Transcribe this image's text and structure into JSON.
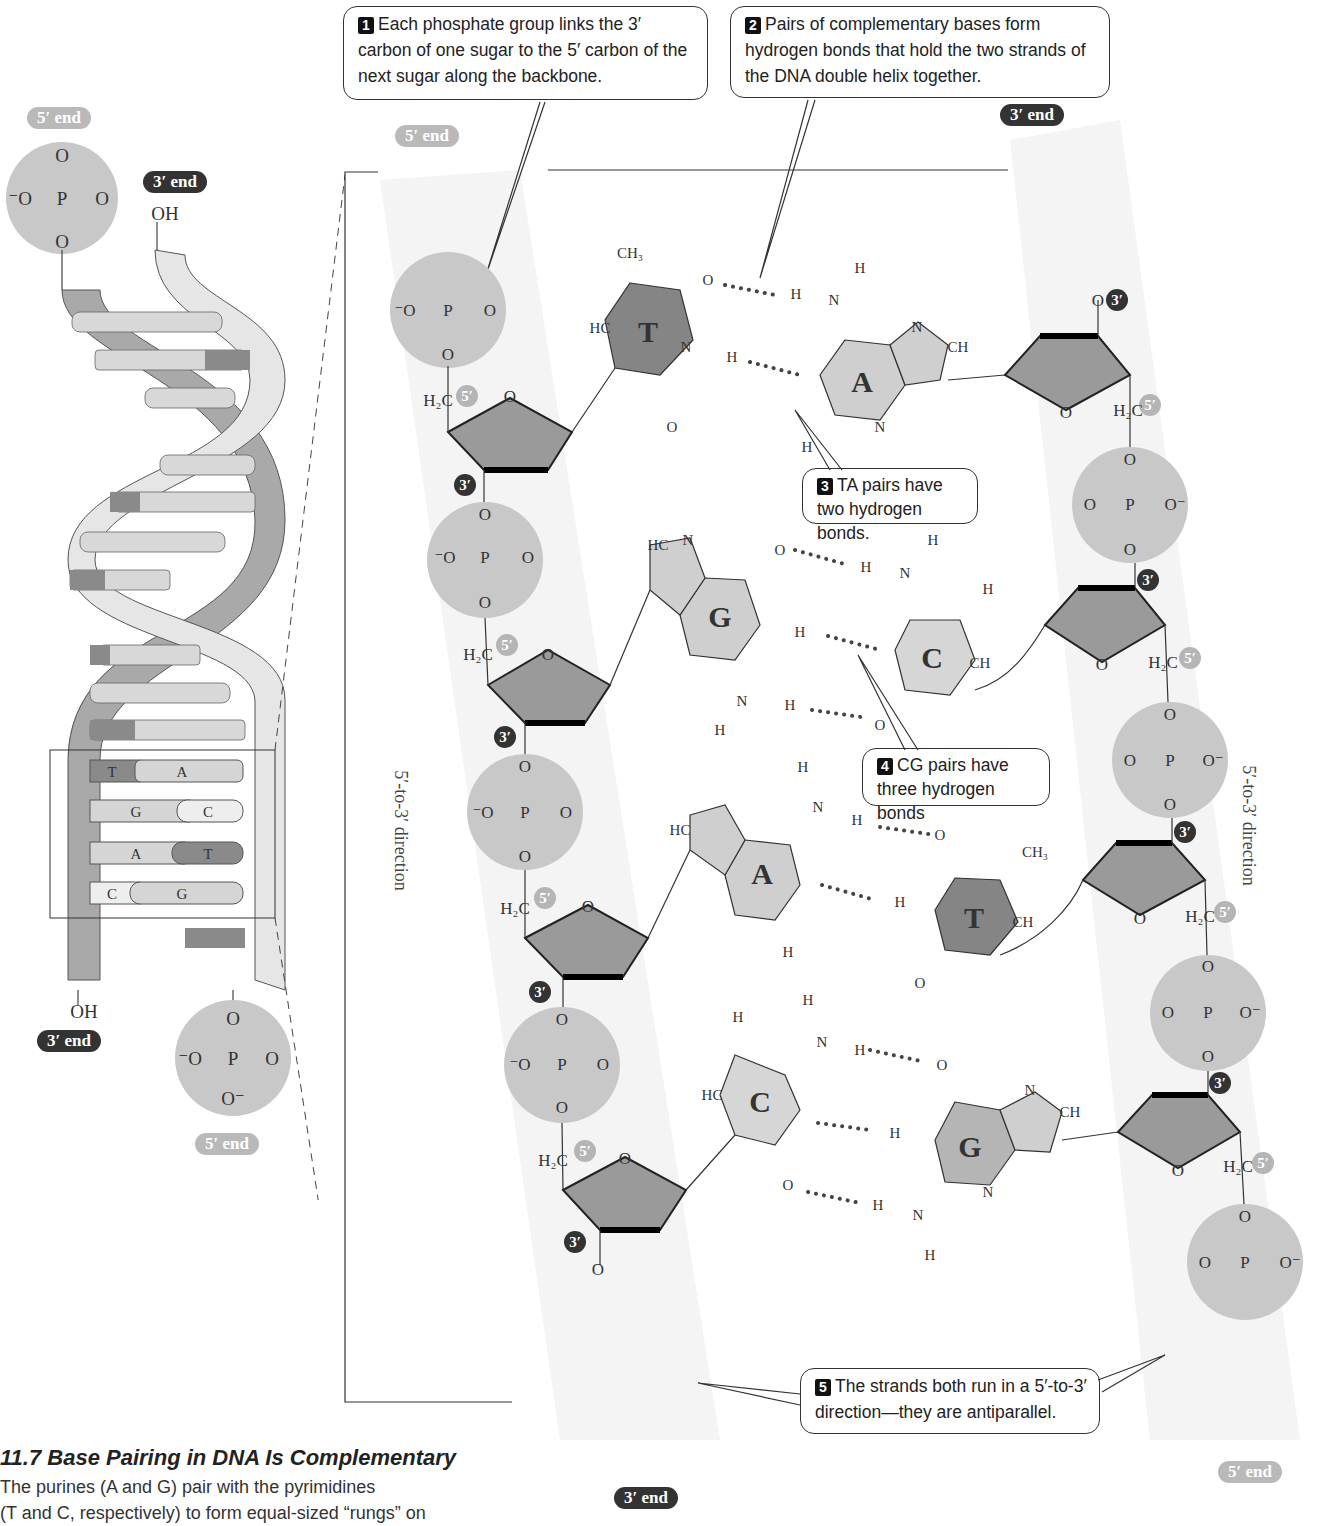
{
  "figure": {
    "number": "11.7",
    "title": "11.7  Base Pairing in DNA Is Complementary",
    "caption": "The purines (A and G) pair with the pyrimidines (T and C, respectively) to form equal-sized “rungs” on",
    "caption_visible_lines": [
      "The purines (A and G) pair with the pyrimidines",
      "(T and C, respectively) to form equal-sized “rungs” on"
    ]
  },
  "callouts": [
    {
      "num": "1",
      "text": "Each phosphate group links the 3′ carbon of one sugar to the 5′ carbon of the next sugar along the backbone."
    },
    {
      "num": "2",
      "text": "Pairs of complementary bases form hydrogen bonds that hold the two strands of the DNA double helix together."
    },
    {
      "num": "3",
      "text": "TA pairs have two hydrogen bonds."
    },
    {
      "num": "4",
      "text": "CG pairs have three hydrogen bonds"
    },
    {
      "num": "5",
      "text": "The strands both run in a 5′-to-3′ direction—they are antiparallel."
    }
  ],
  "end_labels": {
    "five_prime": "5′ end",
    "three_prime": "3′ end"
  },
  "helix": {
    "top_left_end": "5′ end",
    "top_right_end": "3′ end",
    "top_right_group": "OH",
    "bottom_left_end": "3′ end",
    "bottom_left_group": "OH",
    "bottom_right_end": "5′ end",
    "highlighted_pairs": [
      {
        "left": "T",
        "right": "A"
      },
      {
        "left": "G",
        "right": "C"
      },
      {
        "left": "A",
        "right": "T"
      },
      {
        "left": "C",
        "right": "G"
      }
    ]
  },
  "strand_labels": {
    "continues": [
      "Strand",
      "continues"
    ],
    "direction": "5′-to-3′ direction"
  },
  "base_pairs": [
    {
      "left": "T",
      "right": "A",
      "hbonds": 2
    },
    {
      "left": "G",
      "right": "C",
      "hbonds": 3
    },
    {
      "left": "A",
      "right": "T",
      "hbonds": 2
    },
    {
      "left": "C",
      "right": "G",
      "hbonds": 3
    }
  ],
  "atoms": {
    "phosphate_P": "P",
    "oxygen": "O",
    "ch2": "H₂C",
    "hydrogen": "H",
    "carbon": "C",
    "nitrogen": "N",
    "ch": "CH",
    "hc": "HC",
    "ch3": "CH₃",
    "o_minus": "⁻O",
    "o_minus_r": "O⁻",
    "prime5": "5′",
    "prime3": "3′"
  },
  "colors": {
    "phosphate": "#c8c8c8",
    "sugar": "#9a9a9a",
    "purine": "#cfcfcf",
    "pyrimidine_T": "#858585",
    "pyrimidine_C": "#d6d6d6",
    "five_prime_badge": "#b5b5b5",
    "three_prime_badge": "#333333",
    "backbone_shade": "#f2f2f2"
  }
}
